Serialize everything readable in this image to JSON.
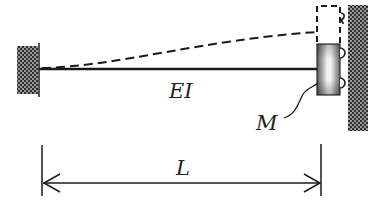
{
  "diagram": {
    "type": "cantilever beam with end mass on roller guide",
    "labels": {
      "stiffness": "EI",
      "mass": "M",
      "length": "L"
    },
    "elements": {
      "left_support": "fixed wall (hatched)",
      "beam": "horizontal beam",
      "end_mass": "mass block on rollers",
      "right_support": "wall with roller guide (hatched)",
      "deflected_shape": "dashed curve",
      "displaced_mass": "dashed box",
      "dimension": "double-arrow dimension line"
    },
    "colors": {
      "line": "#1a1a1a",
      "hatch_dark": "#3a3a3a",
      "hatch_light": "#9a9a9a",
      "mass_edge": "#555555",
      "mass_center": "#f2f2f2"
    }
  }
}
